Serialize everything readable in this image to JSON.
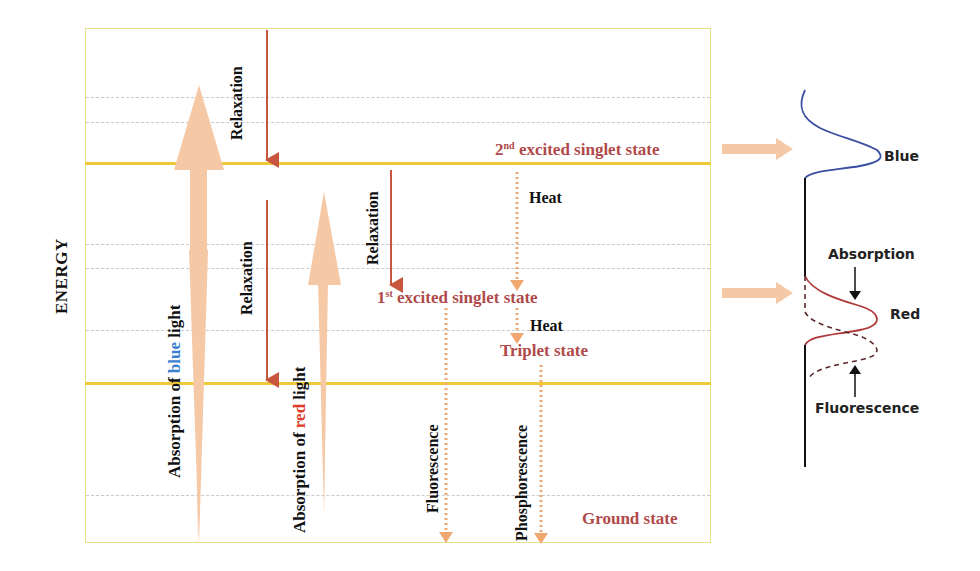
{
  "axis": {
    "label": "ENERGY"
  },
  "states": {
    "second_excited": {
      "ordinal": "2",
      "sup": "nd",
      "text": " excited singlet state"
    },
    "first_excited": {
      "ordinal": "1",
      "sup": "st",
      "text": " excited singlet state"
    },
    "triplet": {
      "text": "Triplet state"
    },
    "ground": {
      "text": "Ground state"
    }
  },
  "arrows": {
    "absorption_blue": {
      "prefix": "Absorption of ",
      "color_word": "blue",
      "suffix": " light",
      "color_word_hex": "#3b7fd0"
    },
    "absorption_red": {
      "prefix": "Absorption of ",
      "color_word": "red",
      "suffix": " light",
      "color_word_hex": "#e03a2a"
    },
    "relaxation_1": "Relaxation",
    "relaxation_2": "Relaxation",
    "relaxation_3": "Relaxation",
    "heat_1": "Heat",
    "heat_2": "Heat",
    "fluorescence": "Fluorescence",
    "phosphorescence": "Phosphorescence"
  },
  "spectrum": {
    "blue_label": "Blue",
    "red_label": "Red",
    "absorption_label": "Absorption",
    "fluorescence_label": "Fluorescence"
  },
  "colors": {
    "state_text": "#b04a4a",
    "level_line": "#f0c93a",
    "absorption_arrow": "#f5c8a6",
    "relaxation_arrow": "#c8553d",
    "dotted_arrow": "#f0a870",
    "blue_curve": "#3a4fa0",
    "red_curve": "#b03a3a"
  }
}
